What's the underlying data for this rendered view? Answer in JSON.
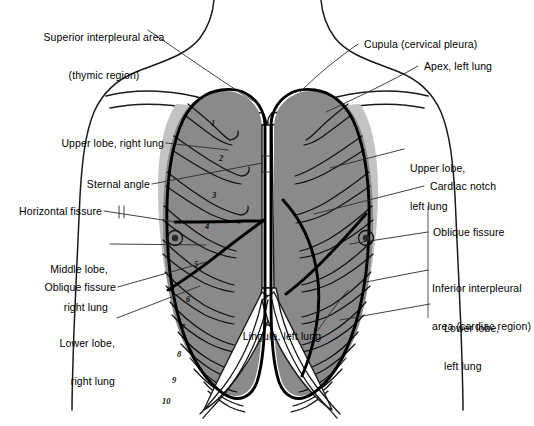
{
  "figure": {
    "caption": ""
  },
  "colors": {
    "lung_fill": "#8a8a8a",
    "lung_fill_light": "#b8b8b8",
    "outline": "#1a1a1a",
    "pleura_line": "#000000",
    "background": "#ffffff",
    "leader_line": "#2b2b2b"
  },
  "labels": {
    "superior_interpleural": {
      "line1": "Superior interpleural area",
      "line2": "(thymic region)"
    },
    "cupula": "Cupula (cervical pleura)",
    "apex_left": "Apex, left lung",
    "upper_lobe_right": "Upper lobe, right lung",
    "upper_lobe_left": {
      "line1": "Upper lobe,",
      "line2": "left lung"
    },
    "sternal_angle": "Sternal angle",
    "cardiac_notch": "Cardiac notch",
    "horizontal_fissure": "Horizontal fissure",
    "middle_lobe_right": {
      "line1": "Middle lobe,",
      "line2": "right lung"
    },
    "oblique_fissure_left_side": "Oblique fissure",
    "oblique_fissure_right_side": "Oblique fissure",
    "inferior_interpleural": {
      "line1": "Inferior interpleural",
      "line2": "area (cardiac region)"
    },
    "lower_lobe_right": {
      "line1": "Lower lobe,",
      "line2": "right lung"
    },
    "lower_lobe_left": {
      "line1": "Lower lobe,",
      "line2": "left lung"
    },
    "lingula_left": "Lingula, left lung"
  },
  "rib_numbers": [
    "1",
    "2",
    "3",
    "4",
    "5",
    "6",
    "7",
    "8",
    "9",
    "10"
  ],
  "markers": {
    "nipple_right": "nipple-marker-right",
    "nipple_left": "nipple-marker-left"
  }
}
